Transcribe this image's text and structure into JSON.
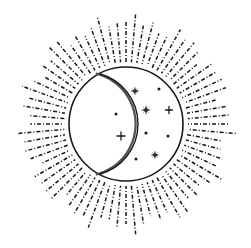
{
  "artwork": {
    "title": "Celestial Emblem",
    "subject": "sun-rays-crescent-moon-stars",
    "style": "line-art-stippled-engraving",
    "canvas": {
      "width": 251,
      "height": 248,
      "background": "#ffffff"
    },
    "colors": {
      "ink": "#1a1a1a",
      "ink_soft": "#3a3a3a",
      "background": "#ffffff",
      "stipple": "#555555"
    },
    "disc": {
      "name": "main-circle",
      "center_x": 126,
      "center_y": 124,
      "radius": 57,
      "stroke_width": 1.6,
      "fill": "#ffffff"
    },
    "crescent": {
      "name": "crescent-moon",
      "orientation": "left-waxing",
      "outer_arc_radius": 57,
      "inner_arc_center_x": 86,
      "inner_arc_center_y": 124,
      "inner_arc_radius": 52,
      "terminator_stroke_width": 1.4,
      "stipple_band_width": 2.5,
      "fill": "#ffffff"
    },
    "rays": {
      "name": "sun-rays",
      "count": 72,
      "angle_step_degrees": 5,
      "inner_radius": 62,
      "outer_radius_min": 92,
      "outer_radius_max": 112,
      "dash_pattern": "4 2 1 2",
      "stroke_width": 1.5
    },
    "stars": [
      {
        "name": "star-sparkle-1",
        "type": "sparkle",
        "cx": 135,
        "cy": 91,
        "size": 9
      },
      {
        "name": "star-dot-1",
        "type": "dot",
        "cx": 159,
        "cy": 89,
        "size": 3
      },
      {
        "name": "star-sparkle-2",
        "type": "sparkle",
        "cx": 146,
        "cy": 110,
        "size": 10
      },
      {
        "name": "star-plus-1",
        "type": "plus",
        "cx": 169,
        "cy": 110,
        "size": 7
      },
      {
        "name": "star-dot-2",
        "type": "dot",
        "cx": 116,
        "cy": 114,
        "size": 3
      },
      {
        "name": "star-plus-2",
        "type": "plus",
        "cx": 121,
        "cy": 136,
        "size": 8
      },
      {
        "name": "star-dot-3",
        "type": "dot",
        "cx": 146,
        "cy": 133,
        "size": 3.2
      },
      {
        "name": "star-dot-4",
        "type": "dot",
        "cx": 168,
        "cy": 136,
        "size": 3
      },
      {
        "name": "star-dot-5",
        "type": "dot",
        "cx": 136,
        "cy": 159,
        "size": 3
      },
      {
        "name": "star-sparkle-3",
        "type": "sparkle",
        "cx": 155,
        "cy": 155,
        "size": 9
      }
    ],
    "labels": {
      "alt_text": "Circular emblem with radiating dashed sun rays surrounding a disc containing a crescent moon and scattered stars"
    }
  }
}
